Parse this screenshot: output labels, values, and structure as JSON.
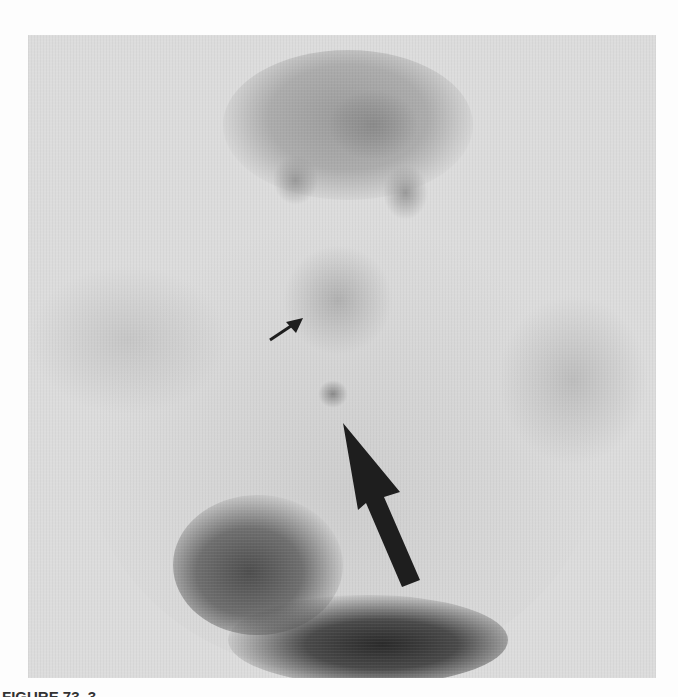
{
  "figure": {
    "type": "grayscale nuclear medicine scan",
    "colors": {
      "background": "#fdfdfd",
      "panel": "#dcdcdc",
      "uptake_dark": "#2a2a2a",
      "arrow": "#1e1e1e"
    },
    "annotations": [
      {
        "name": "small-arrow",
        "tip": [
          303,
          318
        ],
        "tail": [
          270,
          340
        ]
      },
      {
        "name": "large-arrow",
        "tip": [
          343,
          423
        ],
        "tail": [
          410,
          585
        ]
      }
    ],
    "caption": "FIGURE 73. 3"
  }
}
